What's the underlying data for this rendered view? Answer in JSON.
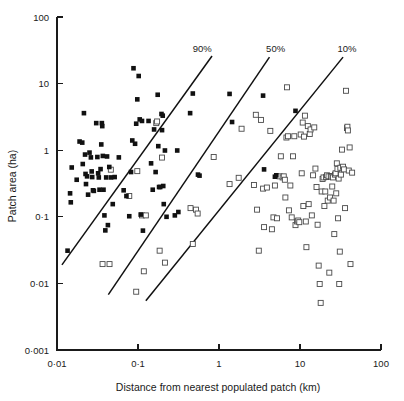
{
  "chart_data": {
    "type": "scatter",
    "title": "",
    "xlabel": "Distance from nearest populated patch (km)",
    "ylabel": "Patch area (ha)",
    "xscale": "log",
    "yscale": "log",
    "xlim": [
      0.01,
      100
    ],
    "ylim": [
      0.001,
      100
    ],
    "grid": false,
    "legend_position": "none",
    "xticks": [
      0.01,
      0.1,
      1,
      10,
      100
    ],
    "xtick_labels": [
      "0·01",
      "0·1",
      "1",
      "10",
      "100"
    ],
    "yticks": [
      0.001,
      0.01,
      0.1,
      1,
      10,
      100
    ],
    "ytick_labels": [
      "0·001",
      "0·01",
      "0·1",
      "1",
      "10",
      "100"
    ],
    "annotations": [
      {
        "text": "90%",
        "x": 0.62,
        "y": 30
      },
      {
        "text": "50%",
        "x": 5.0,
        "y": 30
      },
      {
        "text": "10%",
        "x": 38.0,
        "y": 30
      }
    ],
    "reference_lines": [
      {
        "name": "90%",
        "x_start": 0.0115,
        "y_start": 0.019,
        "x_end": 0.82,
        "y_end": 26.0
      },
      {
        "name": "50%",
        "x_start": 0.043,
        "y_start": 0.0068,
        "x_end": 4.2,
        "y_end": 25.0
      },
      {
        "name": "10%",
        "x_start": 0.125,
        "y_start": 0.0055,
        "x_end": 34.0,
        "y_end": 25.0
      }
    ],
    "series": [
      {
        "name": "filled-square",
        "marker": "filled-square",
        "color": "#111111",
        "points": [
          [
            0.0135,
            0.031
          ],
          [
            0.0145,
            0.225
          ],
          [
            0.0148,
            0.165
          ],
          [
            0.0152,
            0.55
          ],
          [
            0.0175,
            0.36
          ],
          [
            0.019,
            1.35
          ],
          [
            0.0205,
            1.3
          ],
          [
            0.0208,
            0.62
          ],
          [
            0.0215,
            3.6
          ],
          [
            0.0222,
            0.86
          ],
          [
            0.0225,
            0.44
          ],
          [
            0.0228,
            0.31
          ],
          [
            0.0235,
            0.405
          ],
          [
            0.0242,
            0.215
          ],
          [
            0.0252,
            0.92
          ],
          [
            0.0262,
            0.78
          ],
          [
            0.0268,
            0.48
          ],
          [
            0.0272,
            0.395
          ],
          [
            0.0278,
            0.25
          ],
          [
            0.0285,
            0.245
          ],
          [
            0.0305,
            2.55
          ],
          [
            0.0315,
            0.79
          ],
          [
            0.0322,
            0.45
          ],
          [
            0.0328,
            0.39
          ],
          [
            0.0335,
            0.255
          ],
          [
            0.0345,
            0.52
          ],
          [
            0.0352,
            1.22
          ],
          [
            0.0358,
            2.55
          ],
          [
            0.0362,
            2.3
          ],
          [
            0.0368,
            0.82
          ],
          [
            0.0375,
            0.255
          ],
          [
            0.0385,
            0.105
          ],
          [
            0.0395,
            0.0625
          ],
          [
            0.0405,
            0.39
          ],
          [
            0.0415,
            0.805
          ],
          [
            0.0425,
            0.075
          ],
          [
            0.0442,
            0.56
          ],
          [
            0.0465,
            0.39
          ],
          [
            0.0488,
            0.155
          ],
          [
            0.0515,
            0.395
          ],
          [
            0.058,
            0.78
          ],
          [
            0.0665,
            0.25
          ],
          [
            0.072,
            0.205
          ],
          [
            0.078,
            0.102
          ],
          [
            0.082,
            0.47
          ],
          [
            0.085,
            1.4
          ],
          [
            0.088,
            17.0
          ],
          [
            0.092,
            1.25
          ],
          [
            0.095,
            2.5
          ],
          [
            0.098,
            5.8
          ],
          [
            0.102,
            13.0
          ],
          [
            0.105,
            2.9
          ],
          [
            0.108,
            0.108
          ],
          [
            0.112,
            2.75
          ],
          [
            0.115,
            0.062
          ],
          [
            0.135,
            2.75
          ],
          [
            0.145,
            0.635
          ],
          [
            0.152,
            0.255
          ],
          [
            0.158,
            2.05
          ],
          [
            0.165,
            0.47
          ],
          [
            0.175,
            6.8
          ],
          [
            0.178,
            1.15
          ],
          [
            0.182,
            0.28
          ],
          [
            0.188,
            0.28
          ],
          [
            0.195,
            3.5
          ],
          [
            0.198,
            2.0
          ],
          [
            0.202,
            3.3
          ],
          [
            0.205,
            0.29
          ],
          [
            0.208,
            0.155
          ],
          [
            0.215,
            0.99
          ],
          [
            0.225,
            0.1
          ],
          [
            0.285,
            0.105
          ],
          [
            0.305,
            0.99
          ],
          [
            0.315,
            0.118
          ],
          [
            0.44,
            3.6
          ],
          [
            0.475,
            7.1
          ],
          [
            0.55,
            0.43
          ],
          [
            0.575,
            0.415
          ],
          [
            1.35,
            7.0
          ],
          [
            1.45,
            2.65
          ],
          [
            3.5,
            6.6
          ],
          [
            3.6,
            0.515
          ],
          [
            4.9,
            0.4
          ],
          [
            5.1,
            0.42
          ],
          [
            8.8,
            3.9
          ]
        ]
      },
      {
        "name": "open-square",
        "marker": "open-square",
        "color": "#4a4a4a",
        "points": [
          [
            0.0365,
            0.0195
          ],
          [
            0.0445,
            0.0195
          ],
          [
            0.0462,
            0.51
          ],
          [
            0.078,
            0.205
          ],
          [
            0.095,
            0.0075
          ],
          [
            0.098,
            0.485
          ],
          [
            0.112,
            0.105
          ],
          [
            0.118,
            0.0152
          ],
          [
            0.125,
            0.105
          ],
          [
            0.168,
            2.55
          ],
          [
            0.172,
            2.7
          ],
          [
            0.185,
            0.031
          ],
          [
            0.198,
            0.775
          ],
          [
            0.215,
            0.0205
          ],
          [
            0.445,
            0.135
          ],
          [
            0.475,
            0.039
          ],
          [
            0.52,
            0.128
          ],
          [
            0.545,
            0.112
          ],
          [
            0.86,
            0.79
          ],
          [
            1.35,
            0.31
          ],
          [
            1.75,
            0.385
          ],
          [
            1.9,
            2.1
          ],
          [
            2.7,
            0.3
          ],
          [
            2.85,
            3.4
          ],
          [
            2.95,
            0.128
          ],
          [
            3.1,
            0.031
          ],
          [
            3.3,
            2.85
          ],
          [
            3.5,
            0.265
          ],
          [
            3.6,
            0.07
          ],
          [
            3.9,
            0.275
          ],
          [
            4.3,
            1.95
          ],
          [
            4.5,
            0.065
          ],
          [
            4.7,
            0.098
          ],
          [
            4.9,
            0.295
          ],
          [
            5.2,
            0.095
          ],
          [
            5.6,
            0.405
          ],
          [
            5.8,
            0.81
          ],
          [
            6.1,
            0.39
          ],
          [
            6.3,
            0.405
          ],
          [
            6.5,
            0.36
          ],
          [
            6.6,
            0.195
          ],
          [
            6.8,
            1.55
          ],
          [
            6.9,
            8.8
          ],
          [
            7.1,
            1.62
          ],
          [
            7.3,
            0.125
          ],
          [
            7.6,
            0.295
          ],
          [
            7.9,
            0.098
          ],
          [
            8.2,
            0.81
          ],
          [
            8.5,
            1.62
          ],
          [
            8.8,
            0.075
          ],
          [
            9.2,
            0.085
          ],
          [
            9.5,
            0.088
          ],
          [
            9.8,
            0.083
          ],
          [
            10.2,
            1.72
          ],
          [
            10.5,
            0.45
          ],
          [
            10.8,
            2.6
          ],
          [
            11.0,
            0.145
          ],
          [
            11.2,
            1.6
          ],
          [
            11.5,
            3.3
          ],
          [
            11.8,
            0.085
          ],
          [
            12.0,
            0.035
          ],
          [
            12.5,
            2.3
          ],
          [
            12.8,
            0.155
          ],
          [
            13.2,
            1.75
          ],
          [
            13.5,
            2.05
          ],
          [
            14.0,
            0.105
          ],
          [
            14.5,
            0.42
          ],
          [
            15.0,
            2.2
          ],
          [
            15.5,
            0.53
          ],
          [
            16.0,
            0.28
          ],
          [
            16.5,
            0.076
          ],
          [
            17.0,
            0.0185
          ],
          [
            17.5,
            0.0098
          ],
          [
            18.0,
            0.0051
          ],
          [
            18.5,
            0.24
          ],
          [
            19.0,
            0.37
          ],
          [
            19.5,
            0.39
          ],
          [
            20.0,
            0.145
          ],
          [
            20.5,
            0.24
          ],
          [
            21.0,
            0.395
          ],
          [
            21.5,
            0.42
          ],
          [
            22.0,
            0.175
          ],
          [
            22.5,
            0.405
          ],
          [
            23.0,
            0.0145
          ],
          [
            23.5,
            0.195
          ],
          [
            24.0,
            0.41
          ],
          [
            24.5,
            0.4
          ],
          [
            25.0,
            0.285
          ],
          [
            25.5,
            0.39
          ],
          [
            26.0,
            0.175
          ],
          [
            26.5,
            0.055
          ],
          [
            27.0,
            0.43
          ],
          [
            27.5,
            0.45
          ],
          [
            28.0,
            0.225
          ],
          [
            28.5,
            0.635
          ],
          [
            29.0,
            0.525
          ],
          [
            29.5,
            0.095
          ],
          [
            30.0,
            0.375
          ],
          [
            30.5,
            0.0098
          ],
          [
            31.0,
            0.03
          ],
          [
            31.5,
            0.545
          ],
          [
            32.0,
            0.43
          ],
          [
            33.0,
            1.02
          ],
          [
            34.0,
            0.565
          ],
          [
            35.0,
            0.515
          ],
          [
            36.0,
            0.135
          ],
          [
            37.0,
            7.8
          ],
          [
            38.0,
            2.15
          ],
          [
            38.5,
            2.25
          ],
          [
            39.0,
            1.98
          ],
          [
            40.0,
            0.495
          ],
          [
            41.0,
            1.1
          ],
          [
            42.0,
            0.0195
          ],
          [
            44.0,
            0.46
          ]
        ]
      }
    ]
  }
}
